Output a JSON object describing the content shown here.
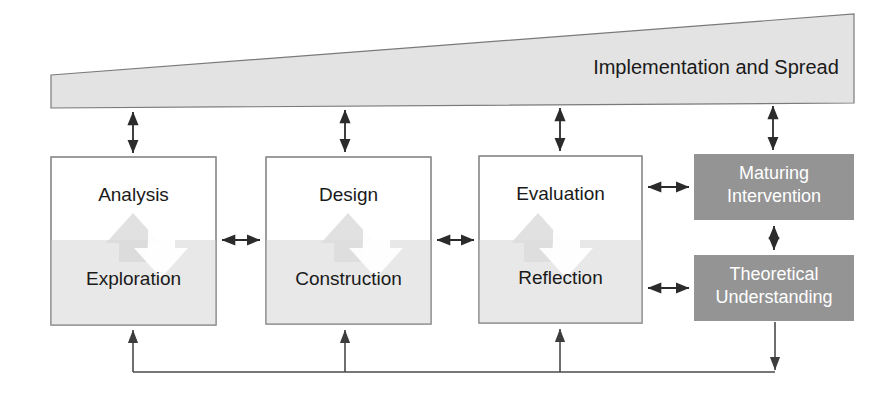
{
  "diagram": {
    "title_text": "Implementation and Spread",
    "wedge": {
      "label": "Implementation and Spread",
      "fill": "#e3e3e3",
      "stroke": "#7a7a7a"
    },
    "colors": {
      "page_background": "#ffffff",
      "box_light_fill": "#e8e8e8",
      "box_white_fill": "#ffffff",
      "box_dark_fill": "#949494",
      "box_stroke": "#8a8a8a",
      "arrow_color": "#2b2b2b",
      "line_color": "#4a4a4a",
      "dark_box_text": "#ffffff",
      "light_box_text": "#1a1a1a",
      "watermark_up_arrow": "#dcdcdc",
      "watermark_down_arrow": "#ffffff"
    },
    "stages": [
      {
        "id": "analysis-exploration",
        "top_label": "Analysis",
        "bottom_label": "Exploration"
      },
      {
        "id": "design-construction",
        "top_label": "Design",
        "bottom_label": "Construction"
      },
      {
        "id": "evaluation-reflection",
        "top_label": "Evaluation",
        "bottom_label": "Reflection"
      }
    ],
    "outputs": [
      {
        "id": "maturing-intervention",
        "line1": "Maturing",
        "line2": "Intervention"
      },
      {
        "id": "theoretical-understanding",
        "line1": "Theoretical",
        "line2": "Understanding"
      }
    ],
    "connectors": [
      {
        "id": "wedge-to-analysis",
        "kind": "double-vertical"
      },
      {
        "id": "wedge-to-design",
        "kind": "double-vertical"
      },
      {
        "id": "wedge-to-evaluation",
        "kind": "double-vertical"
      },
      {
        "id": "wedge-to-maturing-intervention",
        "kind": "double-vertical"
      },
      {
        "id": "analysis-to-design",
        "kind": "double-horizontal"
      },
      {
        "id": "design-to-evaluation",
        "kind": "double-horizontal"
      },
      {
        "id": "evaluation-to-maturing-intervention",
        "kind": "double-horizontal"
      },
      {
        "id": "reflection-to-theoretical-understanding",
        "kind": "double-horizontal"
      },
      {
        "id": "maturing-to-theoretical",
        "kind": "double-vertical"
      },
      {
        "id": "feedback-loop",
        "kind": "feedback-bus"
      }
    ]
  }
}
